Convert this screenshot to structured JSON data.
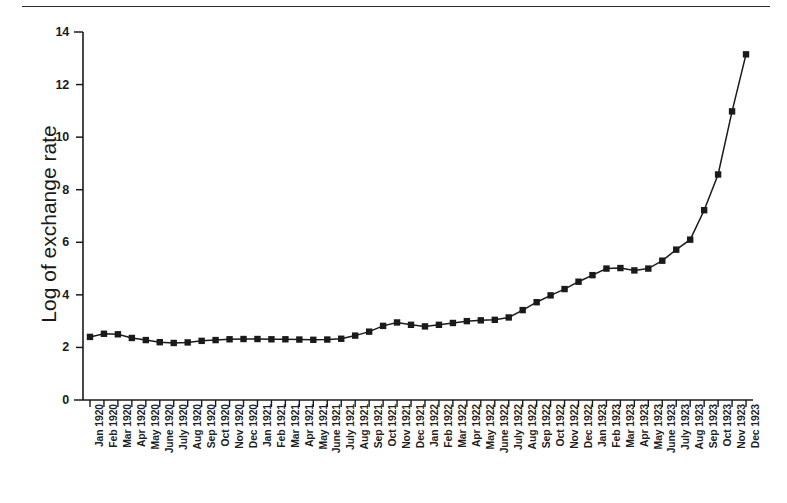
{
  "figure": {
    "top_rule": true,
    "background_color": "#ffffff",
    "line_color": "#1a1a1a",
    "marker_color": "#1a1a1a"
  },
  "chart_data": {
    "type": "line",
    "title": "",
    "xlabel": "",
    "ylabel": "Log of exchange rate",
    "ylim": [
      0,
      14
    ],
    "yticks": [
      0,
      2,
      4,
      6,
      8,
      10,
      12,
      14
    ],
    "ytick_labels": [
      "0",
      "2",
      "4",
      "6",
      "8",
      "10",
      "12",
      "14"
    ],
    "grid": false,
    "legend": "none",
    "marker": "square",
    "categories": [
      "Jan 1920",
      "Feb 1920",
      "Mar 1920",
      "Apr 1920",
      "May 1920",
      "June 1920",
      "July 1920",
      "Aug 1920",
      "Sep 1920",
      "Oct 1920",
      "Nov 1920",
      "Dec 1920",
      "Jan 1921",
      "Feb 1921",
      "Mar 1921",
      "Apr 1921",
      "May 1921",
      "June 1921",
      "July 1921",
      "Aug 1921",
      "Sep 1921",
      "Oct 1921",
      "Nov 1921",
      "Dec 1921",
      "Jan 1922",
      "Feb 1922",
      "Mar 1922",
      "Apr 1922",
      "May 1922",
      "June 1922",
      "July 1922",
      "Aug 1922",
      "Sep 1922",
      "Oct 1922",
      "Nov 1922",
      "Dec 1922",
      "Jan 1923",
      "Feb 1923",
      "Mar 1923",
      "Apr 1923",
      "May 1923",
      "June 1923",
      "July 1923",
      "Aug 1923",
      "Sep 1923",
      "Oct 1923",
      "Nov 1923",
      "Dec 1923"
    ],
    "values": [
      2.4,
      2.52,
      2.5,
      2.36,
      2.28,
      2.2,
      2.17,
      2.19,
      2.25,
      2.28,
      2.31,
      2.32,
      2.32,
      2.31,
      2.31,
      2.3,
      2.29,
      2.3,
      2.33,
      2.45,
      2.6,
      2.82,
      2.95,
      2.86,
      2.8,
      2.86,
      2.93,
      3.0,
      3.03,
      3.05,
      3.14,
      3.42,
      3.72,
      3.98,
      4.22,
      4.5,
      4.75,
      5.0,
      5.02,
      4.93,
      5.0,
      5.3,
      5.72,
      6.1,
      7.22,
      8.58,
      10.98,
      13.15
    ]
  }
}
